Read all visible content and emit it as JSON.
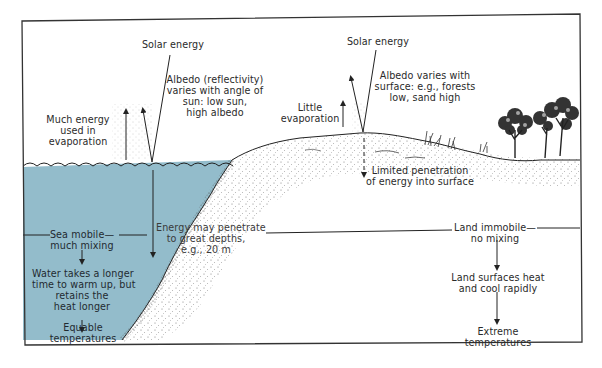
{
  "diagram": {
    "title": "",
    "colors": {
      "water": "#93bccb",
      "ink": "#2a2a2a",
      "frame": "#333333",
      "land_stipple": "#555555"
    },
    "sea_side": {
      "solar_energy": "Solar energy",
      "albedo": [
        "Albedo (reflectivity)",
        "varies with angle of",
        "sun: low sun,",
        "high albedo"
      ],
      "evaporation": [
        "Much energy",
        "used in",
        "evaporation"
      ],
      "mixing": [
        "Sea mobile—",
        "much mixing"
      ],
      "warming": [
        "Water takes a longer",
        "time to warm up, but",
        "retains the",
        "heat longer"
      ],
      "result": [
        "Equable",
        "temperatures"
      ],
      "penetration": [
        "Energy may penetrate",
        "to great depths,",
        "e.g., 20 m"
      ]
    },
    "land_side": {
      "solar_energy": "Solar energy",
      "albedo": [
        "Albedo varies with",
        "surface: e.g., forests",
        "low, sand high"
      ],
      "evaporation": [
        "Little",
        "evaporation"
      ],
      "penetration": [
        "Limited penetration",
        "of energy into surface"
      ],
      "mixing": [
        "Land immobile—",
        "no mixing"
      ],
      "heating": [
        "Land surfaces heat",
        "and cool rapidly"
      ],
      "result": [
        "Extreme",
        "temperatures"
      ]
    }
  }
}
